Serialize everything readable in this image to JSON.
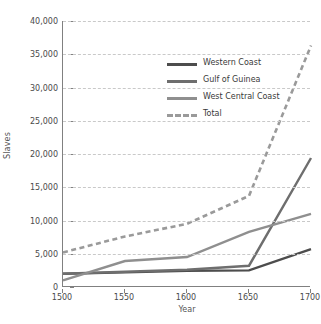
{
  "chart_data": {
    "type": "line",
    "title": "",
    "xlabel": "Year",
    "ylabel": "Slaves",
    "x": [
      1500,
      1550,
      1600,
      1650,
      1700
    ],
    "xticklabels": [
      "1500",
      "1550",
      "1600",
      "1650",
      "1700"
    ],
    "xlim": [
      1500,
      1700
    ],
    "ylim": [
      0,
      40000
    ],
    "yticks": [
      0,
      5000,
      10000,
      15000,
      20000,
      25000,
      30000,
      35000,
      40000
    ],
    "yticklabels": [
      "0",
      "5,000",
      "10,000",
      "15,000",
      "20,000",
      "25,000",
      "30,000",
      "35,000",
      "40,000"
    ],
    "grid": true,
    "grid_style": "dashed",
    "legend_position": "upper-left-inside",
    "series": [
      {
        "name": "Western Coast",
        "color": "#4d4d4d",
        "style": "solid",
        "values": [
          2000,
          2200,
          2450,
          2500,
          5700
        ]
      },
      {
        "name": "Gulf of Guinea",
        "color": "#6e6e6e",
        "style": "solid",
        "values": [
          2000,
          2300,
          2600,
          3200,
          19400
        ]
      },
      {
        "name": "West Central Coast",
        "color": "#8f8f8f",
        "style": "solid",
        "values": [
          1000,
          3900,
          4500,
          8300,
          11000
        ]
      },
      {
        "name": "Total",
        "color": "#9a9a9a",
        "style": "dashed",
        "values": [
          5200,
          7600,
          9500,
          13700,
          36300
        ]
      }
    ]
  },
  "axes": {
    "ylabel": "Slaves",
    "xlabel": "Year"
  },
  "legend": {
    "items": [
      {
        "label": "Western Coast"
      },
      {
        "label": "Gulf of Guinea"
      },
      {
        "label": "West Central Coast"
      },
      {
        "label": "Total"
      }
    ]
  },
  "colors": {
    "grid": "#c9c9c9",
    "axis": "#808080",
    "text": "#3a3a3a",
    "background": "#ffffff"
  }
}
